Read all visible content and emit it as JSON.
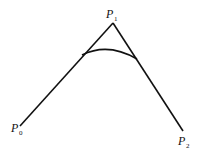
{
  "diagram": {
    "points": [
      {
        "id": "P0",
        "base": "P",
        "sub": "0"
      },
      {
        "id": "P1",
        "base": "P",
        "sub": "1"
      },
      {
        "id": "P2",
        "base": "P",
        "sub": "2"
      }
    ],
    "colors": {
      "stroke": "#111111",
      "background": "#ffffff"
    }
  }
}
